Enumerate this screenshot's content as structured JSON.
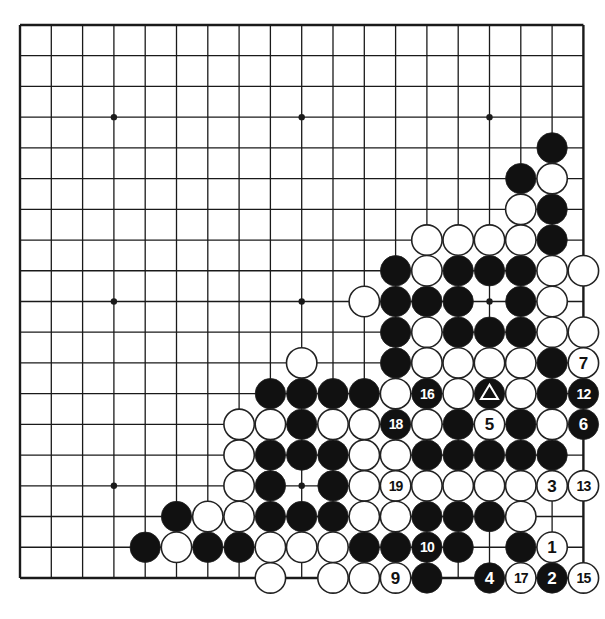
{
  "board": {
    "size": 19,
    "origin_x": 20,
    "origin_y": 25,
    "spacing_x": 31.3,
    "spacing_y": 30.72,
    "stone_radius": 15.2,
    "line_color": "#1a1a1a",
    "black_color": "#111111",
    "white_color": "#ffffff",
    "star_points": [
      [
        3,
        3
      ],
      [
        9,
        3
      ],
      [
        15,
        3
      ],
      [
        3,
        9
      ],
      [
        9,
        9
      ],
      [
        15,
        9
      ],
      [
        3,
        15
      ],
      [
        9,
        15
      ],
      [
        15,
        15
      ]
    ],
    "visible_region": {
      "min_col": 0,
      "max_col": 18,
      "min_row": 0,
      "max_row": 18
    }
  },
  "stones": [
    {
      "c": 17,
      "r": 4,
      "color": "B"
    },
    {
      "c": 16,
      "r": 5,
      "color": "B"
    },
    {
      "c": 17,
      "r": 5,
      "color": "W"
    },
    {
      "c": 16,
      "r": 6,
      "color": "W"
    },
    {
      "c": 17,
      "r": 6,
      "color": "B"
    },
    {
      "c": 13,
      "r": 7,
      "color": "W"
    },
    {
      "c": 14,
      "r": 7,
      "color": "W"
    },
    {
      "c": 15,
      "r": 7,
      "color": "W"
    },
    {
      "c": 16,
      "r": 7,
      "color": "W"
    },
    {
      "c": 17,
      "r": 7,
      "color": "B"
    },
    {
      "c": 12,
      "r": 8,
      "color": "B"
    },
    {
      "c": 13,
      "r": 8,
      "color": "W"
    },
    {
      "c": 14,
      "r": 8,
      "color": "B"
    },
    {
      "c": 15,
      "r": 8,
      "color": "B"
    },
    {
      "c": 16,
      "r": 8,
      "color": "B"
    },
    {
      "c": 17,
      "r": 8,
      "color": "W"
    },
    {
      "c": 18,
      "r": 8,
      "color": "W"
    },
    {
      "c": 11,
      "r": 9,
      "color": "W"
    },
    {
      "c": 12,
      "r": 9,
      "color": "B"
    },
    {
      "c": 13,
      "r": 9,
      "color": "B"
    },
    {
      "c": 14,
      "r": 9,
      "color": "B"
    },
    {
      "c": 16,
      "r": 9,
      "color": "B"
    },
    {
      "c": 17,
      "r": 9,
      "color": "W"
    },
    {
      "c": 12,
      "r": 10,
      "color": "B"
    },
    {
      "c": 13,
      "r": 10,
      "color": "W"
    },
    {
      "c": 14,
      "r": 10,
      "color": "B"
    },
    {
      "c": 15,
      "r": 10,
      "color": "B"
    },
    {
      "c": 16,
      "r": 10,
      "color": "B"
    },
    {
      "c": 17,
      "r": 10,
      "color": "W"
    },
    {
      "c": 18,
      "r": 10,
      "color": "W"
    },
    {
      "c": 9,
      "r": 11,
      "color": "W"
    },
    {
      "c": 12,
      "r": 11,
      "color": "B"
    },
    {
      "c": 13,
      "r": 11,
      "color": "W"
    },
    {
      "c": 14,
      "r": 11,
      "color": "W"
    },
    {
      "c": 15,
      "r": 11,
      "color": "W"
    },
    {
      "c": 16,
      "r": 11,
      "color": "W"
    },
    {
      "c": 17,
      "r": 11,
      "color": "B"
    },
    {
      "c": 18,
      "r": 11,
      "color": "W",
      "label": "7"
    },
    {
      "c": 8,
      "r": 12,
      "color": "B"
    },
    {
      "c": 9,
      "r": 12,
      "color": "B"
    },
    {
      "c": 10,
      "r": 12,
      "color": "B"
    },
    {
      "c": 11,
      "r": 12,
      "color": "B"
    },
    {
      "c": 12,
      "r": 12,
      "color": "W"
    },
    {
      "c": 13,
      "r": 12,
      "color": "B",
      "label": "16"
    },
    {
      "c": 14,
      "r": 12,
      "color": "W"
    },
    {
      "c": 15,
      "r": 12,
      "color": "B",
      "mark": "triangle"
    },
    {
      "c": 16,
      "r": 12,
      "color": "W"
    },
    {
      "c": 17,
      "r": 12,
      "color": "B"
    },
    {
      "c": 18,
      "r": 12,
      "color": "B",
      "label": "12"
    },
    {
      "c": 7,
      "r": 13,
      "color": "W"
    },
    {
      "c": 8,
      "r": 13,
      "color": "W"
    },
    {
      "c": 9,
      "r": 13,
      "color": "B"
    },
    {
      "c": 10,
      "r": 13,
      "color": "W"
    },
    {
      "c": 11,
      "r": 13,
      "color": "W"
    },
    {
      "c": 12,
      "r": 13,
      "color": "B",
      "label": "18"
    },
    {
      "c": 13,
      "r": 13,
      "color": "W"
    },
    {
      "c": 14,
      "r": 13,
      "color": "B"
    },
    {
      "c": 15,
      "r": 13,
      "color": "W",
      "label": "5"
    },
    {
      "c": 16,
      "r": 13,
      "color": "B"
    },
    {
      "c": 17,
      "r": 13,
      "color": "W"
    },
    {
      "c": 18,
      "r": 13,
      "color": "B",
      "label": "6"
    },
    {
      "c": 7,
      "r": 14,
      "color": "W"
    },
    {
      "c": 8,
      "r": 14,
      "color": "B"
    },
    {
      "c": 9,
      "r": 14,
      "color": "B"
    },
    {
      "c": 10,
      "r": 14,
      "color": "B"
    },
    {
      "c": 11,
      "r": 14,
      "color": "W"
    },
    {
      "c": 12,
      "r": 14,
      "color": "W"
    },
    {
      "c": 13,
      "r": 14,
      "color": "B"
    },
    {
      "c": 14,
      "r": 14,
      "color": "B"
    },
    {
      "c": 15,
      "r": 14,
      "color": "B"
    },
    {
      "c": 16,
      "r": 14,
      "color": "B"
    },
    {
      "c": 17,
      "r": 14,
      "color": "B"
    },
    {
      "c": 7,
      "r": 15,
      "color": "W"
    },
    {
      "c": 8,
      "r": 15,
      "color": "B"
    },
    {
      "c": 10,
      "r": 15,
      "color": "B"
    },
    {
      "c": 11,
      "r": 15,
      "color": "W"
    },
    {
      "c": 12,
      "r": 15,
      "color": "W",
      "label": "19"
    },
    {
      "c": 13,
      "r": 15,
      "color": "W"
    },
    {
      "c": 14,
      "r": 15,
      "color": "W"
    },
    {
      "c": 15,
      "r": 15,
      "color": "W"
    },
    {
      "c": 16,
      "r": 15,
      "color": "W"
    },
    {
      "c": 17,
      "r": 15,
      "color": "W",
      "label": "3"
    },
    {
      "c": 18,
      "r": 15,
      "color": "W",
      "label": "13"
    },
    {
      "c": 5,
      "r": 16,
      "color": "B"
    },
    {
      "c": 6,
      "r": 16,
      "color": "W"
    },
    {
      "c": 7,
      "r": 16,
      "color": "W"
    },
    {
      "c": 8,
      "r": 16,
      "color": "B"
    },
    {
      "c": 9,
      "r": 16,
      "color": "B"
    },
    {
      "c": 10,
      "r": 16,
      "color": "B"
    },
    {
      "c": 11,
      "r": 16,
      "color": "W"
    },
    {
      "c": 12,
      "r": 16,
      "color": "W"
    },
    {
      "c": 13,
      "r": 16,
      "color": "B"
    },
    {
      "c": 14,
      "r": 16,
      "color": "B"
    },
    {
      "c": 15,
      "r": 16,
      "color": "B"
    },
    {
      "c": 16,
      "r": 16,
      "color": "W"
    },
    {
      "c": 4,
      "r": 17,
      "color": "B"
    },
    {
      "c": 5,
      "r": 17,
      "color": "W"
    },
    {
      "c": 6,
      "r": 17,
      "color": "B"
    },
    {
      "c": 7,
      "r": 17,
      "color": "B"
    },
    {
      "c": 8,
      "r": 17,
      "color": "W"
    },
    {
      "c": 9,
      "r": 17,
      "color": "W"
    },
    {
      "c": 10,
      "r": 17,
      "color": "W"
    },
    {
      "c": 11,
      "r": 17,
      "color": "B"
    },
    {
      "c": 12,
      "r": 17,
      "color": "B"
    },
    {
      "c": 13,
      "r": 17,
      "color": "B",
      "label": "10"
    },
    {
      "c": 14,
      "r": 17,
      "color": "B"
    },
    {
      "c": 16,
      "r": 17,
      "color": "B"
    },
    {
      "c": 17,
      "r": 17,
      "color": "W",
      "label": "1"
    },
    {
      "c": 8,
      "r": 18,
      "color": "W"
    },
    {
      "c": 10,
      "r": 18,
      "color": "W"
    },
    {
      "c": 11,
      "r": 18,
      "color": "W"
    },
    {
      "c": 12,
      "r": 18,
      "color": "W",
      "label": "9"
    },
    {
      "c": 13,
      "r": 18,
      "color": "B"
    },
    {
      "c": 15,
      "r": 18,
      "color": "B",
      "label": "4"
    },
    {
      "c": 16,
      "r": 18,
      "color": "W",
      "label": "17"
    },
    {
      "c": 17,
      "r": 18,
      "color": "B",
      "label": "2"
    },
    {
      "c": 18,
      "r": 18,
      "color": "W",
      "label": "15"
    }
  ]
}
